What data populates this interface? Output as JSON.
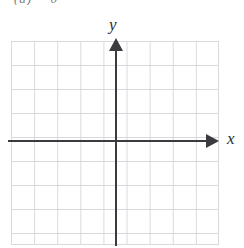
{
  "figure": {
    "kind": "blank-cartesian-grid",
    "clipped_header_text": "(a)   =   0",
    "background_color": "#ffffff"
  },
  "grid": {
    "columns": 9,
    "rows": 8.5,
    "cell_width_px": 23,
    "cell_height_px": 24,
    "line_color": "#d9d9dd",
    "left_px": 11,
    "top_px": 41,
    "width_px": 208,
    "height_px": 204
  },
  "axes": {
    "color": "#3b3b3f",
    "origin_x_px": 116,
    "origin_y_px": 141,
    "x_axis": {
      "label": "x",
      "orientation": "horizontal",
      "arrow_direction": "right",
      "start_px": 8,
      "end_px": 219
    },
    "y_axis": {
      "label": "y",
      "orientation": "vertical",
      "arrow_direction": "up",
      "start_px": 38,
      "end_px": 246
    }
  },
  "chart_data": {
    "type": "scatter",
    "title": "",
    "subtitle": "",
    "xlabel": "x",
    "ylabel": "y",
    "xlim": [
      -5,
      4
    ],
    "ylim": [
      -4.25,
      4.25
    ],
    "xticks": [
      -5,
      -4,
      -3,
      -2,
      -1,
      0,
      1,
      2,
      3,
      4
    ],
    "yticks": [
      -4,
      -3,
      -2,
      -1,
      0,
      1,
      2,
      3,
      4
    ],
    "xticklabels": [
      "",
      "",
      "",
      "",
      "",
      "",
      "",
      "",
      "",
      ""
    ],
    "yticklabels": [
      "",
      "",
      "",
      "",
      "",
      "",
      "",
      "",
      ""
    ],
    "grid": true,
    "legend": null,
    "legend_position": "none",
    "series": [],
    "x": [],
    "values": [],
    "annotations": [],
    "note": "Empty coordinate plane template — no data plotted"
  }
}
